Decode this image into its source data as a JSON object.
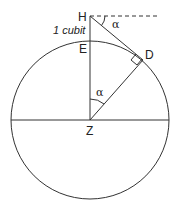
{
  "diagram": {
    "labels": {
      "H": "H",
      "E": "E",
      "D": "D",
      "Z": "Z",
      "height": "1 cubit",
      "alpha_top": "α",
      "alpha_center": "α"
    },
    "colors": {
      "stroke": "#333333",
      "text": "#222222",
      "background": "#ffffff"
    }
  }
}
